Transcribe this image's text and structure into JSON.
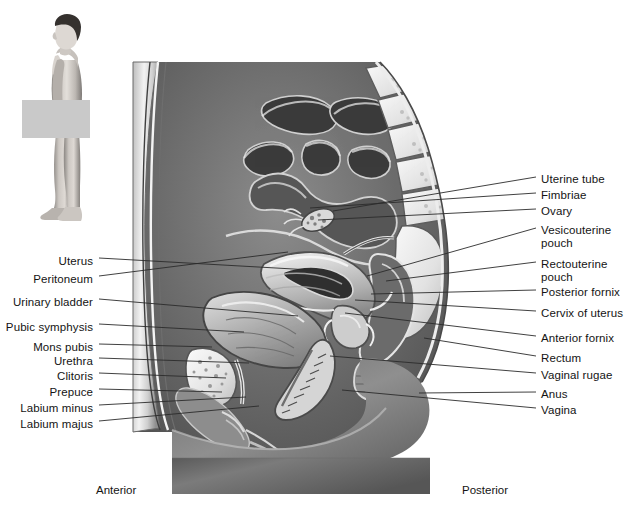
{
  "figure": {
    "orientation": {
      "anterior": "Anterior",
      "posterior": "Posterior"
    },
    "inset": {
      "name": "lateral-view-whole-body-figure",
      "section_band_color": "#c9c9c9"
    },
    "colors": {
      "background": "#ffffff",
      "leader_line": "#2b2b2b",
      "text": "#141414",
      "band": "#c9c9c9"
    }
  },
  "labels_left": [
    {
      "text": "Uterus",
      "x": 93,
      "y": 255,
      "line_from_x": 99,
      "line_from_y": 258,
      "line_to_x": 311,
      "line_to_y": 270
    },
    {
      "text": "Peritoneum",
      "x": 93,
      "y": 273,
      "line_from_x": 99,
      "line_from_y": 276,
      "line_to_x": 288,
      "line_to_y": 252
    },
    {
      "text": "Urinary bladder",
      "x": 93,
      "y": 296,
      "line_from_x": 99,
      "line_from_y": 299,
      "line_to_x": 298,
      "line_to_y": 316
    },
    {
      "text": "Pubic symphysis",
      "x": 93,
      "y": 321,
      "line_from_x": 99,
      "line_from_y": 324,
      "line_to_x": 244,
      "line_to_y": 332
    },
    {
      "text": "Mons pubis",
      "x": 93,
      "y": 341,
      "line_from_x": 99,
      "line_from_y": 344,
      "line_to_x": 212,
      "line_to_y": 347
    },
    {
      "text": "Urethra",
      "x": 93,
      "y": 355,
      "line_from_x": 99,
      "line_from_y": 358,
      "line_to_x": 249,
      "line_to_y": 363
    },
    {
      "text": "Clitoris",
      "x": 93,
      "y": 370,
      "line_from_x": 99,
      "line_from_y": 373,
      "line_to_x": 226,
      "line_to_y": 378
    },
    {
      "text": "Prepuce",
      "x": 93,
      "y": 386,
      "line_from_x": 99,
      "line_from_y": 389,
      "line_to_x": 222,
      "line_to_y": 392
    },
    {
      "text": "Labium minus",
      "x": 93,
      "y": 402,
      "line_from_x": 99,
      "line_from_y": 405,
      "line_to_x": 246,
      "line_to_y": 397
    },
    {
      "text": "Labium majus",
      "x": 93,
      "y": 418,
      "line_from_x": 99,
      "line_from_y": 421,
      "line_to_x": 259,
      "line_to_y": 406
    }
  ],
  "labels_right": [
    {
      "text": "Uterine tube",
      "x": 541,
      "y": 173,
      "line_from_x": 536,
      "line_from_y": 177,
      "line_to_x": 333,
      "line_to_y": 211
    },
    {
      "text": "Fimbriae",
      "x": 541,
      "y": 189,
      "line_from_x": 536,
      "line_from_y": 193,
      "line_to_x": 310,
      "line_to_y": 208
    },
    {
      "text": "Ovary",
      "x": 541,
      "y": 205,
      "line_from_x": 536,
      "line_from_y": 209,
      "line_to_x": 318,
      "line_to_y": 220
    },
    {
      "text": "Vesicouterine\npouch",
      "x": 541,
      "y": 224,
      "line_from_x": 536,
      "line_from_y": 228,
      "line_to_x": 367,
      "line_to_y": 276
    },
    {
      "text": "Rectouterine\npouch",
      "x": 541,
      "y": 258,
      "line_from_x": 536,
      "line_from_y": 262,
      "line_to_x": 386,
      "line_to_y": 281
    },
    {
      "text": "Posterior fornix",
      "x": 541,
      "y": 286,
      "line_from_x": 536,
      "line_from_y": 290,
      "line_to_x": 371,
      "line_to_y": 294
    },
    {
      "text": "Cervix of uterus",
      "x": 541,
      "y": 307,
      "line_from_x": 536,
      "line_from_y": 311,
      "line_to_x": 355,
      "line_to_y": 300
    },
    {
      "text": "Anterior fornix",
      "x": 541,
      "y": 332,
      "line_from_x": 536,
      "line_from_y": 336,
      "line_to_x": 345,
      "line_to_y": 313
    },
    {
      "text": "Rectum",
      "x": 541,
      "y": 352,
      "line_from_x": 536,
      "line_from_y": 356,
      "line_to_x": 424,
      "line_to_y": 338
    },
    {
      "text": "Vaginal rugae",
      "x": 541,
      "y": 369,
      "line_from_x": 536,
      "line_from_y": 373,
      "line_to_x": 330,
      "line_to_y": 356
    },
    {
      "text": "Anus",
      "x": 541,
      "y": 388,
      "line_from_x": 536,
      "line_from_y": 392,
      "line_to_x": 419,
      "line_to_y": 393
    },
    {
      "text": "Vagina",
      "x": 541,
      "y": 404,
      "line_from_x": 536,
      "line_from_y": 408,
      "line_to_x": 342,
      "line_to_y": 390
    }
  ],
  "orientation_marks": [
    {
      "text": "Anterior",
      "x": 96,
      "y": 484
    },
    {
      "text": "Posterior",
      "x": 462,
      "y": 484
    }
  ]
}
